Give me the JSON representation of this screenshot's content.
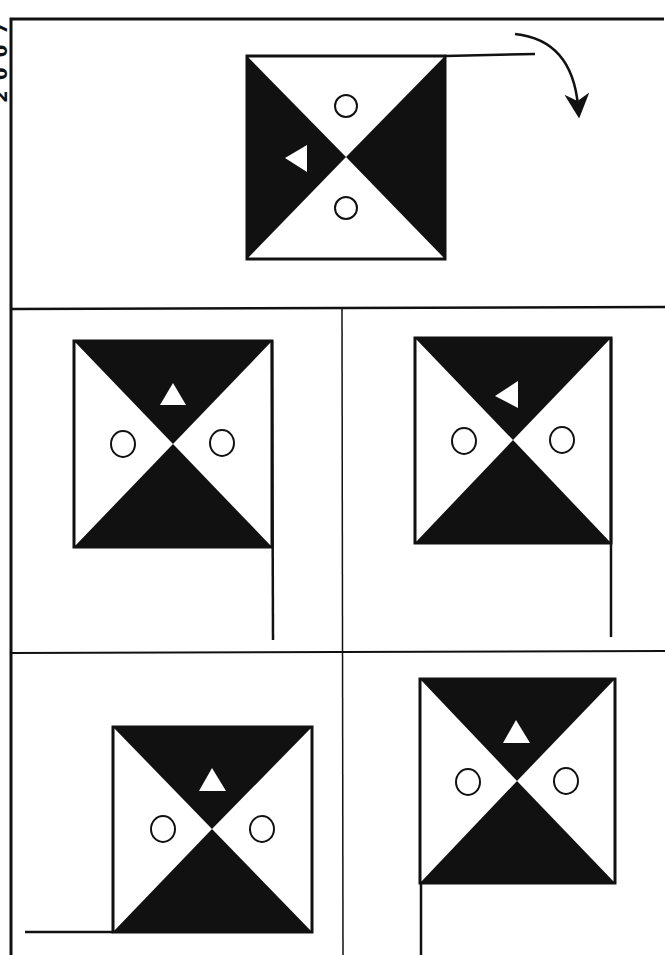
{
  "puzzle": {
    "edge_label": "2 0 0 7",
    "instruction_arrow": "rotate-clockwise",
    "colors": {
      "ink": "#111111",
      "paper": "#ffffff"
    },
    "question": {
      "description": "Flag with pole on top edge extending right; rotated clockwise",
      "symbols": [
        "circle-top",
        "circle-bottom",
        "triangle-left-pointing"
      ]
    },
    "options": [
      {
        "id": "A",
        "pole": "right-down",
        "triangle": "up"
      },
      {
        "id": "B",
        "pole": "right-down",
        "triangle": "left"
      },
      {
        "id": "C",
        "pole": "bottom-left",
        "triangle": "up"
      },
      {
        "id": "D",
        "pole": "left-down",
        "triangle": "up"
      }
    ]
  }
}
